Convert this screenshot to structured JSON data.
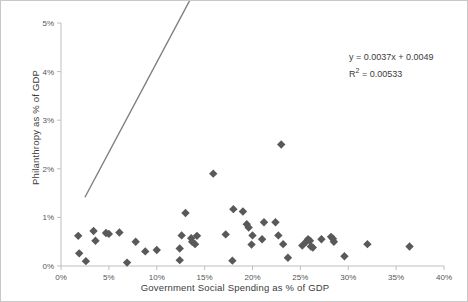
{
  "chart_data": {
    "type": "scatter",
    "title": "",
    "xlabel": "Government Social Spending as % of GDP",
    "ylabel": "Philanthropy as % of GDP",
    "xlim": [
      0,
      40
    ],
    "ylim": [
      0,
      5
    ],
    "x_ticks": [
      "0%",
      "5%",
      "10%",
      "15%",
      "20%",
      "25%",
      "30%",
      "35%",
      "40%"
    ],
    "x_tick_values": [
      0,
      5,
      10,
      15,
      20,
      25,
      30,
      35,
      40
    ],
    "y_ticks": [
      "0%",
      "1%",
      "2%",
      "3%",
      "4%",
      "5%"
    ],
    "y_tick_values": [
      0,
      1,
      2,
      3,
      4,
      5
    ],
    "grid": false,
    "legend": "none",
    "marker": "diamond",
    "marker_color": "#595959",
    "trendline": {
      "equation": "y = 0.0037x + 0.0049",
      "r_squared_label": "R² = 0.00533",
      "slope": 0.0037,
      "intercept": 0.0049,
      "r_squared": 0.00533,
      "color": "#7f7f7f",
      "x_start": 2.5,
      "x_end": 36.5
    },
    "points": [
      {
        "x": 1.8,
        "y": 0.62
      },
      {
        "x": 1.9,
        "y": 0.26
      },
      {
        "x": 2.6,
        "y": 0.1
      },
      {
        "x": 3.4,
        "y": 0.72
      },
      {
        "x": 3.6,
        "y": 0.52
      },
      {
        "x": 4.7,
        "y": 0.68
      },
      {
        "x": 5.0,
        "y": 0.66
      },
      {
        "x": 6.1,
        "y": 0.69
      },
      {
        "x": 6.9,
        "y": 0.07
      },
      {
        "x": 7.8,
        "y": 0.5
      },
      {
        "x": 8.8,
        "y": 0.3
      },
      {
        "x": 10.0,
        "y": 0.33
      },
      {
        "x": 12.4,
        "y": 0.36
      },
      {
        "x": 12.4,
        "y": 0.12
      },
      {
        "x": 12.6,
        "y": 0.63
      },
      {
        "x": 13.0,
        "y": 1.09
      },
      {
        "x": 13.6,
        "y": 0.57
      },
      {
        "x": 13.7,
        "y": 0.5
      },
      {
        "x": 14.0,
        "y": 0.45
      },
      {
        "x": 14.2,
        "y": 0.62
      },
      {
        "x": 15.9,
        "y": 1.9
      },
      {
        "x": 17.2,
        "y": 0.65
      },
      {
        "x": 17.9,
        "y": 0.11
      },
      {
        "x": 18.0,
        "y": 1.17
      },
      {
        "x": 19.0,
        "y": 1.12
      },
      {
        "x": 19.4,
        "y": 0.86
      },
      {
        "x": 19.6,
        "y": 0.79
      },
      {
        "x": 19.9,
        "y": 0.44
      },
      {
        "x": 20.0,
        "y": 0.63
      },
      {
        "x": 21.0,
        "y": 0.55
      },
      {
        "x": 21.2,
        "y": 0.9
      },
      {
        "x": 22.4,
        "y": 0.9
      },
      {
        "x": 22.7,
        "y": 0.63
      },
      {
        "x": 23.0,
        "y": 2.5
      },
      {
        "x": 23.2,
        "y": 0.45
      },
      {
        "x": 23.7,
        "y": 0.17
      },
      {
        "x": 25.2,
        "y": 0.42
      },
      {
        "x": 25.6,
        "y": 0.5
      },
      {
        "x": 25.8,
        "y": 0.55
      },
      {
        "x": 26.0,
        "y": 0.52
      },
      {
        "x": 26.1,
        "y": 0.4
      },
      {
        "x": 26.3,
        "y": 0.38
      },
      {
        "x": 27.2,
        "y": 0.55
      },
      {
        "x": 28.2,
        "y": 0.6
      },
      {
        "x": 28.4,
        "y": 0.56
      },
      {
        "x": 28.5,
        "y": 0.5
      },
      {
        "x": 29.6,
        "y": 0.2
      },
      {
        "x": 32.0,
        "y": 0.45
      },
      {
        "x": 36.4,
        "y": 0.4
      }
    ]
  },
  "annotations": {
    "equation_text": "y = 0.0037x + 0.0049",
    "r2_prefix": "R",
    "r2_sup": "2",
    "r2_value": " = 0.00533"
  }
}
